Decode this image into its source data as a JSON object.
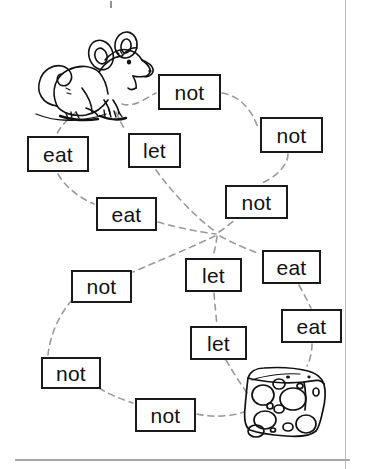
{
  "worksheet": {
    "title": "Mouse and cheese maze word worksheet",
    "ink_color": "#1a1a1a",
    "path_color": "#9a9a9a",
    "background_color": "#ffffff",
    "top_speck_label": "stray-ink-mark"
  },
  "illustrations": [
    {
      "name": "mouse-illustration",
      "label": "mouse",
      "x": 15,
      "y": 32,
      "width": 110,
      "height": 85
    },
    {
      "name": "cheese-illustration",
      "label": "cheese wedge",
      "x": 243,
      "y": 366,
      "width": 84,
      "height": 72
    }
  ],
  "word_boxes": [
    {
      "id": "box-not-1",
      "word": "not",
      "x": 158,
      "y": 74,
      "width": 63,
      "height": 36
    },
    {
      "id": "box-not-2",
      "word": "not",
      "x": 260,
      "y": 117,
      "width": 63,
      "height": 36
    },
    {
      "id": "box-eat-1",
      "word": "eat",
      "x": 27,
      "y": 136,
      "width": 62,
      "height": 36
    },
    {
      "id": "box-let-1",
      "word": "let",
      "x": 128,
      "y": 133,
      "width": 53,
      "height": 35
    },
    {
      "id": "box-not-3",
      "word": "not",
      "x": 225,
      "y": 185,
      "width": 63,
      "height": 34
    },
    {
      "id": "box-eat-2",
      "word": "eat",
      "x": 96,
      "y": 197,
      "width": 61,
      "height": 34
    },
    {
      "id": "box-eat-3",
      "word": "eat",
      "x": 262,
      "y": 250,
      "width": 59,
      "height": 34
    },
    {
      "id": "box-let-2",
      "word": "let",
      "x": 185,
      "y": 258,
      "width": 57,
      "height": 34
    },
    {
      "id": "box-not-4",
      "word": "not",
      "x": 71,
      "y": 270,
      "width": 61,
      "height": 33
    },
    {
      "id": "box-eat-4",
      "word": "eat",
      "x": 281,
      "y": 309,
      "width": 61,
      "height": 34
    },
    {
      "id": "box-let-3",
      "word": "let",
      "x": 190,
      "y": 326,
      "width": 57,
      "height": 34
    },
    {
      "id": "box-not-5",
      "word": "not",
      "x": 41,
      "y": 357,
      "width": 60,
      "height": 32
    },
    {
      "id": "box-not-6",
      "word": "not",
      "x": 135,
      "y": 398,
      "width": 61,
      "height": 34
    }
  ],
  "connector_paths": [
    {
      "name": "path-mouse-to-not1",
      "d": "M 122,104 C 134,108 146,98 156,93"
    },
    {
      "name": "path-not1-to-not2",
      "d": "M 222,93 C 240,96 252,110 258,128"
    },
    {
      "name": "path-mouse-to-eat1",
      "d": "M 76,112 C 68,120 60,126 57,134"
    },
    {
      "name": "path-mouse-to-let1",
      "d": "M 116,112 C 120,120 122,126 126,131"
    },
    {
      "name": "path-eat1-to-eat2",
      "d": "M 58,174 C 66,188 80,198 94,204"
    },
    {
      "name": "path-let1-to-hub",
      "d": "M 156,170 C 170,190 196,218 216,232"
    },
    {
      "name": "path-not2-to-not3",
      "d": "M 288,154 C 288,166 274,178 262,183"
    },
    {
      "name": "path-eat2-to-hub",
      "d": "M 158,222 C 178,228 200,232 216,234"
    },
    {
      "name": "path-hub-to-not3",
      "d": "M 219,232 C 228,226 232,222 236,219"
    },
    {
      "name": "path-hub-to-let2",
      "d": "M 217,236 C 216,246 214,252 213,256"
    },
    {
      "name": "path-hub-to-eat3",
      "d": "M 220,236 C 234,244 250,250 260,254"
    },
    {
      "name": "path-hub-to-not4",
      "d": "M 215,236 C 190,248 156,262 133,272"
    },
    {
      "name": "path-let2-to-let3",
      "d": "M 214,293 C 215,305 216,316 217,325"
    },
    {
      "name": "path-eat3-to-eat4",
      "d": "M 299,285 C 304,294 308,302 311,308"
    },
    {
      "name": "path-eat4-to-cheese",
      "d": "M 312,344 C 312,352 310,360 307,366"
    },
    {
      "name": "path-not4-to-not5",
      "d": "M 72,300 C 58,316 50,336 48,355"
    },
    {
      "name": "path-not5-to-not6",
      "d": "M 99,388 C 112,396 124,400 133,403"
    },
    {
      "name": "path-not6-to-cheese",
      "d": "M 197,414 C 214,418 232,416 244,412"
    },
    {
      "name": "path-let3-to-cheese",
      "d": "M 226,360 C 234,374 242,386 248,394"
    }
  ]
}
